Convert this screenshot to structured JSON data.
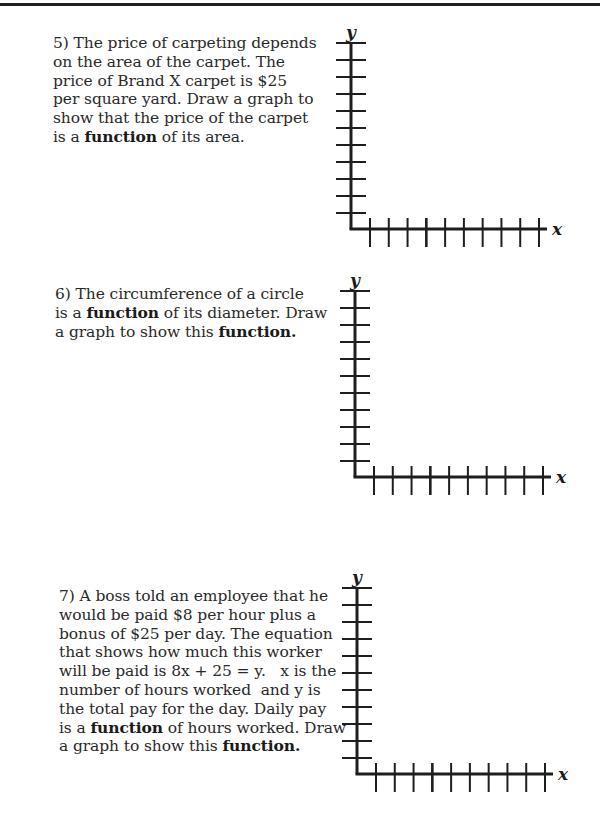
{
  "page": {
    "background": "#ffffff",
    "ink_color": "#1e1e1e"
  },
  "problems": [
    {
      "number": "5)",
      "lines": [
        [
          {
            "t": "5) The price of carpeting depends"
          }
        ],
        [
          {
            "t": "on the area of the carpet. The"
          }
        ],
        [
          {
            "t": "price of Brand X carpet is $25"
          }
        ],
        [
          {
            "t": "per square yard. Draw a graph to"
          }
        ],
        [
          {
            "t": "show that the price of the carpet"
          }
        ],
        [
          {
            "t": "is a "
          },
          {
            "t": "function",
            "b": true
          },
          {
            "t": " of its area."
          }
        ]
      ],
      "graph": {
        "x_label": "x",
        "y_label": "y",
        "y_ticks": 11,
        "x_ticks": 10
      }
    },
    {
      "number": "6)",
      "lines": [
        [
          {
            "t": "6) The circumference of a circle"
          }
        ],
        [
          {
            "t": "is a "
          },
          {
            "t": "function",
            "b": true
          },
          {
            "t": " of its diameter. Draw"
          }
        ],
        [
          {
            "t": "a graph to show this "
          },
          {
            "t": "function.",
            "b": true
          }
        ]
      ],
      "graph": {
        "x_label": "x",
        "y_label": "y",
        "y_ticks": 11,
        "x_ticks": 10
      }
    },
    {
      "number": "7)",
      "lines": [
        [
          {
            "t": "7) A boss told an employee that he"
          }
        ],
        [
          {
            "t": "would be paid $8 per hour plus a"
          }
        ],
        [
          {
            "t": "bonus of $25 per day. The equation"
          }
        ],
        [
          {
            "t": "that shows how much this worker"
          }
        ],
        [
          {
            "t": "will be paid is 8x + 25 = y.   x is the"
          }
        ],
        [
          {
            "t": "number of hours worked  and y is"
          }
        ],
        [
          {
            "t": "the total pay for the day. Daily pay"
          }
        ],
        [
          {
            "t": "is a "
          },
          {
            "t": "function",
            "b": true
          },
          {
            "t": " of hours worked. Draw"
          }
        ],
        [
          {
            "t": "a graph to show this "
          },
          {
            "t": "function.",
            "b": true
          }
        ]
      ],
      "graph": {
        "x_label": "x",
        "y_label": "y",
        "y_ticks": 11,
        "x_ticks": 10
      }
    }
  ]
}
